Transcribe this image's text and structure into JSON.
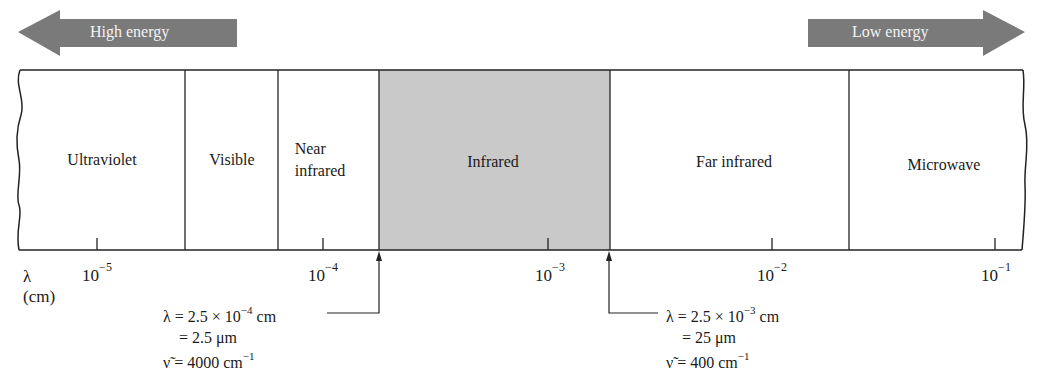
{
  "energy_arrows": {
    "left": {
      "label": "High energy",
      "direction": "left",
      "color": "#7a7a7a"
    },
    "right": {
      "label": "Low energy",
      "direction": "right",
      "color": "#7a7a7a"
    }
  },
  "regions": [
    {
      "name": "Ultraviolet",
      "label": "Ultraviolet",
      "shaded": false
    },
    {
      "name": "Visible",
      "label": "Visible",
      "shaded": false
    },
    {
      "name": "Near infrared",
      "label_line1": "Near",
      "label_line2": "infrared",
      "shaded": false
    },
    {
      "name": "Infrared",
      "label": "Infrared",
      "shaded": true,
      "fill": "#c8c8c8"
    },
    {
      "name": "Far infrared",
      "label": "Far infrared",
      "shaded": false
    },
    {
      "name": "Microwave",
      "label": "Microwave",
      "shaded": false
    }
  ],
  "axis": {
    "symbol": "λ",
    "unit": "(cm)",
    "ticks": [
      {
        "base": "10",
        "exp": "−5"
      },
      {
        "base": "10",
        "exp": "−4"
      },
      {
        "base": "10",
        "exp": "−3"
      },
      {
        "base": "10",
        "exp": "−2"
      },
      {
        "base": "10",
        "exp": "−1"
      }
    ]
  },
  "annotations": {
    "lower_bound": {
      "line1_pre": "λ = 2.5 × 10",
      "line1_exp": "−4",
      "line1_post": " cm",
      "line2": "= 2.5 μm",
      "line3_pre": "ν̃ = 4000 cm",
      "line3_exp": "−1"
    },
    "upper_bound": {
      "line1_pre": "λ = 2.5 × 10",
      "line1_exp": "−3",
      "line1_post": " cm",
      "line2": "= 25 μm",
      "line3_pre": "ν̃ = 400 cm",
      "line3_exp": "−1"
    }
  }
}
